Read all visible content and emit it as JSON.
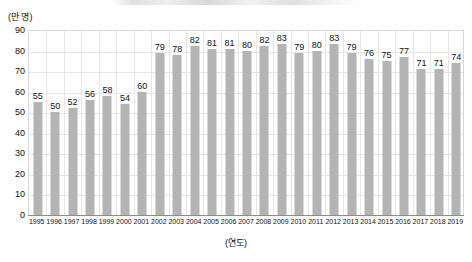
{
  "chart_data": {
    "type": "bar",
    "title": "",
    "subtitle": "",
    "xlabel": "(연도)",
    "ylabel": "(만 명)",
    "ylim": [
      0,
      90
    ],
    "ytick_step": 10,
    "yticks": [
      90,
      80,
      70,
      60,
      50,
      40,
      30,
      20,
      10,
      0
    ],
    "grid": "both",
    "legend": "none",
    "bar_color": "#b4b4b4",
    "categories": [
      "1995",
      "1996",
      "1997",
      "1998",
      "1999",
      "2000",
      "2001",
      "2002",
      "2003",
      "2004",
      "2005",
      "2006",
      "2007",
      "2008",
      "2009",
      "2010",
      "2011",
      "2012",
      "2013",
      "2014",
      "2015",
      "2016",
      "2017",
      "2018",
      "2019"
    ],
    "values": [
      55,
      50,
      52,
      56,
      58,
      54,
      60,
      79,
      78,
      82,
      81,
      81,
      80,
      82,
      83,
      79,
      80,
      83,
      79,
      76,
      75,
      77,
      71,
      71,
      74
    ],
    "series": [
      {
        "name": "",
        "values": [
          55,
          50,
          52,
          56,
          58,
          54,
          60,
          79,
          78,
          82,
          81,
          81,
          80,
          82,
          83,
          79,
          80,
          83,
          79,
          76,
          75,
          77,
          71,
          71,
          74
        ]
      }
    ],
    "data_labels_shown": true
  }
}
